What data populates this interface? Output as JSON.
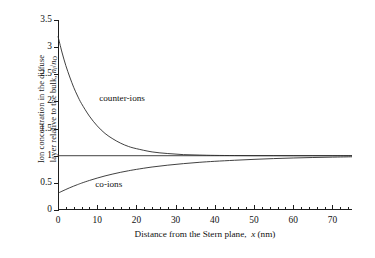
{
  "chart_data": {
    "type": "line",
    "title": "",
    "xlabel_plain": "Distance from the Stern plane, x (nm)",
    "xlabel_parts": {
      "lead": "Distance from the Stern plane,",
      "symbol": "x",
      "unit": "(nm)"
    },
    "ylabel_plain": "Ion concentration in the diffuse layer relative to the bulk, ni/nO",
    "ylabel_parts": {
      "line1": "Ion concentration in the diffuse",
      "line2_lead": "layer relative to the bulk,",
      "line2_sym_num": "n",
      "line2_sub_num": "i",
      "line2_slash": "/",
      "line2_sym_den": "n",
      "line2_sub_den": "O"
    },
    "xlim": [
      0,
      75
    ],
    "ylim": [
      0,
      3.5
    ],
    "xticks": [
      0,
      10,
      20,
      30,
      40,
      50,
      60,
      70
    ],
    "xticklabels": [
      "0",
      "10",
      "20",
      "30",
      "40",
      "50",
      "60",
      "70"
    ],
    "x_minor_interval": 2,
    "yticks": [
      0,
      0.5,
      1,
      1.5,
      2,
      2.5,
      3,
      3.5
    ],
    "yticklabels": [
      "0",
      "0.5",
      "1",
      "1.5",
      "2",
      "2.5",
      "3",
      "3.5"
    ],
    "grid": false,
    "legend_position": "inline-annotations",
    "axis_style": "open-left-bottom",
    "line_color": "#2b2b2b",
    "series": [
      {
        "name": "counter-ions",
        "annotation": "counter-ions",
        "annotation_xy": [
          10.5,
          2.05
        ],
        "model": "exp_decay_above_one",
        "y0": 3.2,
        "y_inf": 1.0,
        "decay_length_nm": 7.2,
        "x": [
          0,
          1,
          2,
          3,
          4,
          5,
          6,
          8,
          10,
          12,
          14,
          16,
          18,
          20,
          24,
          28,
          32,
          36,
          40,
          45,
          50,
          55,
          60,
          65,
          70,
          75
        ],
        "values": [
          3.2,
          2.91,
          2.66,
          2.45,
          2.26,
          2.1,
          1.96,
          1.73,
          1.55,
          1.41,
          1.31,
          1.23,
          1.17,
          1.13,
          1.07,
          1.04,
          1.02,
          1.012,
          1.006,
          1.003,
          1.001,
          1.001,
          1.0,
          1.0,
          1.0,
          1.0
        ]
      },
      {
        "name": "co-ions",
        "annotation": "co-ions",
        "annotation_xy": [
          9.5,
          0.46
        ],
        "model": "exp_rise_below_one",
        "y0": 0.31,
        "y_inf": 1.0,
        "decay_length_nm": 10.5,
        "x": [
          0,
          1,
          2,
          3,
          4,
          5,
          6,
          8,
          10,
          12,
          14,
          16,
          18,
          20,
          24,
          28,
          32,
          36,
          40,
          45,
          50,
          55,
          60,
          65,
          70,
          75
        ],
        "values": [
          0.31,
          0.345,
          0.378,
          0.41,
          0.44,
          0.468,
          0.495,
          0.544,
          0.588,
          0.628,
          0.663,
          0.695,
          0.723,
          0.748,
          0.792,
          0.826,
          0.854,
          0.878,
          0.897,
          0.916,
          0.933,
          0.947,
          0.958,
          0.967,
          0.974,
          0.98
        ]
      },
      {
        "name": "bulk-reference",
        "annotation": "",
        "model": "constant",
        "x": [
          0,
          75
        ],
        "values": [
          1.0,
          1.0
        ]
      }
    ]
  }
}
